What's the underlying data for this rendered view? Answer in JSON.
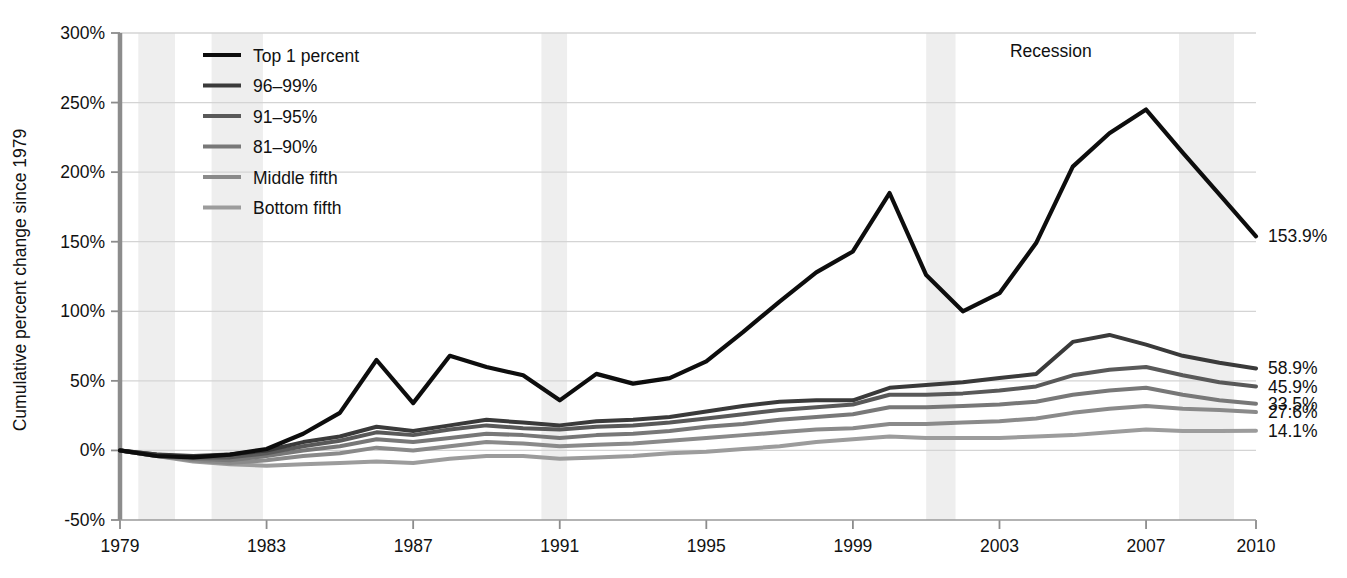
{
  "chart_data": {
    "type": "line",
    "title": "",
    "subtitle": "",
    "xlabel": "",
    "ylabel": "Cumulative percent change since 1979",
    "xlim": [
      1979,
      2010
    ],
    "ylim": [
      -50,
      300
    ],
    "ytick_labels": [
      "300%",
      "250%",
      "200%",
      "150%",
      "100%",
      "50%",
      "0%",
      "-50%"
    ],
    "ytick_values": [
      300,
      250,
      200,
      150,
      100,
      50,
      0,
      -50
    ],
    "xtick_labels": [
      "1979",
      "1983",
      "1987",
      "1991",
      "1995",
      "1999",
      "2003",
      "2007",
      "2010"
    ],
    "xtick_values": [
      1979,
      1983,
      1987,
      1991,
      1995,
      1999,
      2003,
      2007,
      2010
    ],
    "grid": true,
    "legend_position": "top-left",
    "x": [
      1979,
      1980,
      1981,
      1982,
      1983,
      1984,
      1985,
      1986,
      1987,
      1988,
      1989,
      1990,
      1991,
      1992,
      1993,
      1994,
      1995,
      1996,
      1997,
      1998,
      1999,
      2000,
      2001,
      2002,
      2003,
      2004,
      2005,
      2006,
      2007,
      2008,
      2009,
      2010
    ],
    "series": [
      {
        "name": "Top 1 percent",
        "color": "#0d0d0d",
        "width": 4.2,
        "end_label": "153.9%",
        "values": [
          0,
          -4,
          -5,
          -3,
          1,
          12,
          27,
          65,
          34,
          68,
          60,
          54,
          36,
          55,
          48,
          52,
          64,
          85,
          107,
          128,
          143,
          185,
          126,
          100,
          113,
          149,
          204,
          228,
          245,
          214,
          184,
          153.9
        ]
      },
      {
        "name": "96–99%",
        "color": "#3a3a3a",
        "width": 4.0,
        "end_label": "58.9%",
        "values": [
          0,
          -3,
          -4,
          -3,
          0,
          6,
          10,
          17,
          14,
          18,
          22,
          20,
          18,
          21,
          22,
          24,
          28,
          32,
          35,
          36,
          36,
          45,
          47,
          49,
          52,
          55,
          78,
          83,
          76,
          68,
          63,
          58.9
        ]
      },
      {
        "name": "91–95%",
        "color": "#595959",
        "width": 4.0,
        "end_label": "45.9%",
        "values": [
          0,
          -3,
          -5,
          -5,
          -2,
          3,
          7,
          13,
          11,
          15,
          18,
          16,
          15,
          17,
          18,
          20,
          23,
          26,
          29,
          31,
          33,
          40,
          40,
          41,
          43,
          46,
          54,
          58,
          60,
          54,
          49,
          45.9
        ]
      },
      {
        "name": "81–90%",
        "color": "#787878",
        "width": 4.0,
        "end_label": "33.5%",
        "values": [
          0,
          -4,
          -6,
          -7,
          -4,
          0,
          3,
          8,
          6,
          9,
          12,
          11,
          9,
          11,
          12,
          14,
          17,
          19,
          22,
          24,
          26,
          31,
          31,
          32,
          33,
          35,
          40,
          43,
          45,
          40,
          36,
          33.5
        ]
      },
      {
        "name": "Middle fifth",
        "color": "#8a8a8a",
        "width": 4.0,
        "end_label": "27.6%",
        "values": [
          0,
          -4,
          -7,
          -9,
          -7,
          -4,
          -2,
          2,
          0,
          3,
          6,
          5,
          3,
          4,
          5,
          7,
          9,
          11,
          13,
          15,
          16,
          19,
          19,
          20,
          21,
          23,
          27,
          30,
          32,
          30,
          29,
          27.6
        ]
      },
      {
        "name": "Bottom fifth",
        "color": "#9c9c9c",
        "width": 4.0,
        "end_label": "14.1%",
        "values": [
          0,
          -4,
          -8,
          -10,
          -11,
          -10,
          -9,
          -8,
          -9,
          -6,
          -4,
          -4,
          -6,
          -5,
          -4,
          -2,
          -1,
          1,
          3,
          6,
          8,
          10,
          9,
          9,
          9,
          10,
          11,
          13,
          15,
          14,
          14,
          14.1
        ]
      }
    ],
    "recession_bands": [
      {
        "start": 1979.5,
        "end": 1980.5
      },
      {
        "start": 1981.5,
        "end": 1982.9
      },
      {
        "start": 1990.5,
        "end": 1991.2
      },
      {
        "start": 2001.0,
        "end": 2001.8
      },
      {
        "start": 2007.9,
        "end": 2009.4
      }
    ],
    "annotations": [
      {
        "text": "Recession",
        "x": 2004.4,
        "y": 283
      }
    ],
    "colors": {
      "background": "#ffffff",
      "grid": "#d4d4d4",
      "axis": "#808080",
      "text": "#111111",
      "recession_band": "#eeeeee"
    }
  },
  "legend": {
    "items": [
      {
        "label": "Top 1 percent"
      },
      {
        "label": "96–99%"
      },
      {
        "label": "91–95%"
      },
      {
        "label": "81–90%"
      },
      {
        "label": "Middle fifth"
      },
      {
        "label": "Bottom fifth"
      }
    ]
  }
}
